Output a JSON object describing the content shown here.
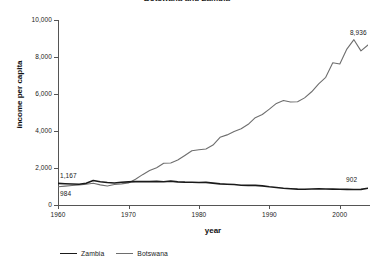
{
  "chart_data": {
    "type": "line",
    "title": "Botswana and Zambia",
    "xlabel": "year",
    "ylabel": "income per capita",
    "xlim": [
      1960,
      2004
    ],
    "ylim": [
      0,
      10000
    ],
    "grid": false,
    "legend_position": "bottom-left",
    "y_ticks": [
      {
        "value": 10000,
        "label": "10,000"
      },
      {
        "value": 8000,
        "label": "8,000"
      },
      {
        "value": 6000,
        "label": "6,000"
      },
      {
        "value": 4000,
        "label": "4,000"
      },
      {
        "value": 2000,
        "label": "2,000"
      },
      {
        "value": 0,
        "label": "0"
      }
    ],
    "x_ticks": [
      {
        "value": 1960,
        "label": "1960"
      },
      {
        "value": 1970,
        "label": "1970"
      },
      {
        "value": 1980,
        "label": "1980"
      },
      {
        "value": 1990,
        "label": "1990"
      },
      {
        "value": 2000,
        "label": "2000"
      }
    ],
    "x": [
      1960,
      1961,
      1962,
      1963,
      1964,
      1965,
      1966,
      1967,
      1968,
      1969,
      1970,
      1971,
      1972,
      1973,
      1974,
      1975,
      1976,
      1977,
      1978,
      1979,
      1980,
      1981,
      1982,
      1983,
      1984,
      1985,
      1986,
      1987,
      1988,
      1989,
      1990,
      1991,
      1992,
      1993,
      1994,
      1995,
      1996,
      1997,
      1998,
      1999,
      2000,
      2001,
      2002,
      2003,
      2004
    ],
    "series": [
      {
        "name": "Zambia",
        "color": "#1a1a1a",
        "values": [
          1167,
          1150,
          1135,
          1120,
          1180,
          1320,
          1255,
          1215,
          1190,
          1230,
          1250,
          1265,
          1270,
          1265,
          1275,
          1255,
          1290,
          1250,
          1235,
          1230,
          1215,
          1225,
          1185,
          1140,
          1120,
          1105,
          1065,
          1060,
          1060,
          1035,
          985,
          950,
          905,
          880,
          860,
          855,
          865,
          875,
          865,
          860,
          855,
          845,
          840,
          845,
          902
        ]
      },
      {
        "name": "Botswana",
        "color": "#6e6e6e",
        "values": [
          984,
          1020,
          1055,
          1085,
          1120,
          1180,
          1090,
          1030,
          1105,
          1140,
          1195,
          1390,
          1640,
          1860,
          2010,
          2260,
          2270,
          2430,
          2680,
          2930,
          2990,
          3030,
          3240,
          3660,
          3790,
          3970,
          4120,
          4360,
          4720,
          4890,
          5180,
          5490,
          5650,
          5570,
          5580,
          5790,
          6120,
          6550,
          6900,
          7690,
          7620,
          8430,
          8936,
          8330,
          8650
        ]
      }
    ],
    "annotations": [
      {
        "name": "zambia-start-value",
        "text": "1,167",
        "series": "Zambia",
        "x": 1960,
        "y": 1167
      },
      {
        "name": "botswana-start-value",
        "text": "984",
        "series": "Botswana",
        "x": 1960,
        "y": 984
      },
      {
        "name": "botswana-peak-value",
        "text": "8,936",
        "series": "Botswana",
        "x": 2002,
        "y": 8936
      },
      {
        "name": "zambia-end-value",
        "text": "902",
        "series": "Zambia",
        "x": 2004,
        "y": 902
      }
    ]
  },
  "legend": {
    "items": [
      {
        "label": "Zambia"
      },
      {
        "label": "Botswana"
      }
    ]
  }
}
